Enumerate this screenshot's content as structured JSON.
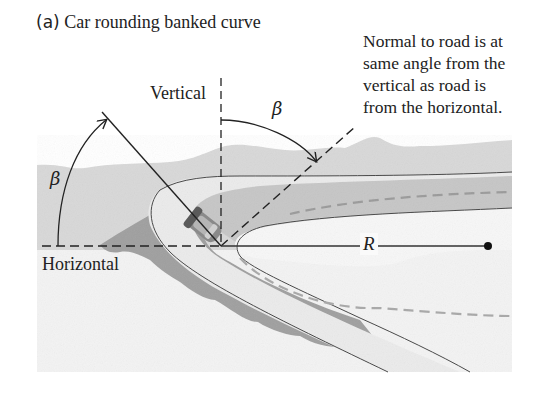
{
  "figure": {
    "panel_tag": "(a)",
    "title": "Car rounding banked curve"
  },
  "labels": {
    "vertical": "Vertical",
    "horizontal": "Horizontal",
    "radius": "R",
    "angle_left": "β",
    "angle_top": "β"
  },
  "annotation": {
    "lines": [
      "Normal to road is at",
      "same angle from the",
      "vertical as road is",
      "from the horizontal."
    ]
  },
  "colors": {
    "ink": "#222222",
    "terrain": "#d6d6d6",
    "road_surface": "#e9e9e9",
    "road_far": "#c4c4c4",
    "embankment_shadow": "#9a9a9a",
    "ground_light": "#f2f2f2"
  }
}
